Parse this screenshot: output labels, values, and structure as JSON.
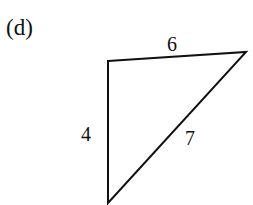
{
  "figure": {
    "part_label": "(d)",
    "shape": "triangle",
    "sides": {
      "top": "6",
      "left": "4",
      "hypotenuse": "7"
    },
    "vertices": [
      [
        108,
        61
      ],
      [
        246,
        52
      ],
      [
        108,
        203
      ]
    ],
    "stroke_color": "#111111"
  }
}
